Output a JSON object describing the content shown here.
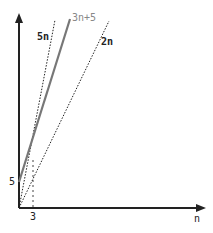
{
  "diagram": {
    "type": "asymptotic-bound-plot",
    "axes": {
      "x_label": "n",
      "y_label": "",
      "x_tick_label": "3",
      "y_tick_label": "5"
    },
    "lines": [
      {
        "label": "5n",
        "style": "dotted",
        "color": "#222222"
      },
      {
        "label": "3n+5",
        "style": "solid",
        "color": "#777777"
      },
      {
        "label": "2n",
        "style": "dotted",
        "color": "#222222"
      }
    ],
    "guide": {
      "style": "dashed",
      "from_x_tick": "3",
      "note": "intersection of 5n and 3n+5 at n=3"
    }
  }
}
